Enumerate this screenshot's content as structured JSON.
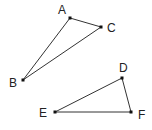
{
  "diagram": {
    "triangles": [
      {
        "name": "ABC",
        "vertices": [
          {
            "id": "A",
            "label": "A",
            "x": 70,
            "y": 18,
            "lx": 62,
            "ly": 14
          },
          {
            "id": "B",
            "label": "B",
            "x": 23,
            "y": 80,
            "lx": 13,
            "ly": 87
          },
          {
            "id": "C",
            "label": "C",
            "x": 101,
            "y": 27,
            "lx": 111,
            "ly": 32
          }
        ]
      },
      {
        "name": "DEF",
        "vertices": [
          {
            "id": "D",
            "label": "D",
            "x": 122,
            "y": 78,
            "lx": 123,
            "ly": 72
          },
          {
            "id": "E",
            "label": "E",
            "x": 55,
            "y": 112,
            "lx": 43,
            "ly": 117
          },
          {
            "id": "F",
            "label": "F",
            "x": 131,
            "y": 112,
            "lx": 142,
            "ly": 119
          }
        ]
      }
    ],
    "colors": {
      "edge": "#333333",
      "point": "#111111",
      "label": "#222222"
    }
  }
}
